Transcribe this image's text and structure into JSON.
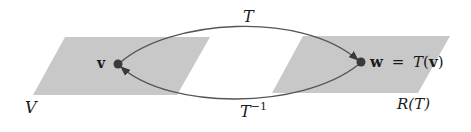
{
  "diagram": {
    "domain_set": {
      "label": "V",
      "fill": "#c8c8c8"
    },
    "range_set": {
      "label": "R(T)",
      "fill": "#c8c8c8"
    },
    "point_v": {
      "label": "v"
    },
    "point_w": {
      "label_w": "w",
      "label_eq": "=",
      "label_T": "T",
      "label_open": "(",
      "label_v": "v",
      "label_close": ")"
    },
    "forward_map": {
      "label": "T"
    },
    "inverse_map": {
      "label": "T",
      "exponent": "−1"
    },
    "colors": {
      "curve": "#555555",
      "point": "#3a3a3a",
      "text": "#1a1a1a"
    }
  }
}
